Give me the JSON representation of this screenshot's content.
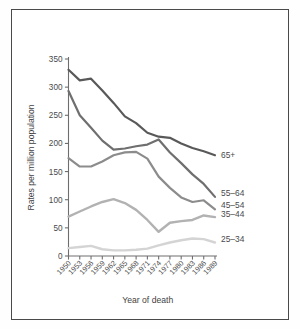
{
  "figure": {
    "background_color": "#ffffff",
    "border_color": "#4a4a4a",
    "axis_color": "#6e6e6e"
  },
  "chart_data": {
    "type": "line",
    "title": "",
    "xlabel": "Year of death",
    "ylabel": "Rates per million population",
    "x": [
      1950,
      1953,
      1956,
      1959,
      1962,
      1965,
      1968,
      1971,
      1974,
      1977,
      1980,
      1983,
      1986,
      1989
    ],
    "categories": [
      "1950",
      "1953",
      "1956",
      "1959",
      "1962",
      "1965",
      "1968",
      "1971",
      "1974",
      "1977",
      "1980",
      "1983",
      "1986",
      "1989"
    ],
    "xtick_labels": [
      "1950",
      "1953",
      "1956",
      "1959",
      "1962",
      "1965",
      "1968",
      "1971",
      "1974",
      "1977",
      "1980",
      "1983",
      "1986",
      "1989"
    ],
    "ytick_labels": [
      "0",
      "50",
      "100",
      "150",
      "200",
      "250",
      "300",
      "350"
    ],
    "yticks": [
      0,
      50,
      100,
      150,
      200,
      250,
      300,
      350
    ],
    "ylim": [
      0,
      350
    ],
    "xlim": [
      1950,
      1989
    ],
    "grid": false,
    "legend_position": "right-inline",
    "series": [
      {
        "name": "65+",
        "label": "65+",
        "color": "#595959",
        "width": 2.2,
        "values": [
          331,
          312,
          315,
          294,
          272,
          248,
          236,
          219,
          212,
          210,
          200,
          192,
          186,
          179
        ]
      },
      {
        "name": "55-64",
        "label": "55–64",
        "color": "#6f6f6f",
        "width": 2.2,
        "values": [
          293,
          250,
          228,
          205,
          189,
          191,
          195,
          198,
          207,
          184,
          165,
          145,
          128,
          105
        ]
      },
      {
        "name": "45-54",
        "label": "45–54",
        "color": "#8c8c8c",
        "width": 2.2,
        "values": [
          174,
          159,
          159,
          168,
          179,
          184,
          185,
          173,
          141,
          121,
          104,
          96,
          99,
          83
        ]
      },
      {
        "name": "35-44",
        "label": "35–44",
        "color": "#b2b2b2",
        "width": 2.4,
        "values": [
          70,
          79,
          88,
          96,
          101,
          94,
          82,
          64,
          43,
          59,
          62,
          64,
          72,
          69
        ]
      },
      {
        "name": "25-34",
        "label": "25–34",
        "color": "#d4d4d4",
        "width": 2.4,
        "values": [
          14,
          16,
          18,
          12,
          10,
          10,
          11,
          13,
          19,
          24,
          28,
          31,
          30,
          24
        ]
      }
    ]
  }
}
